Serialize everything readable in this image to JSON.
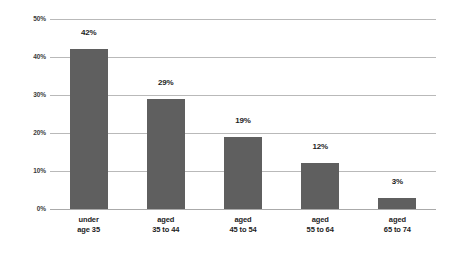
{
  "chart_data": {
    "type": "bar",
    "title": "",
    "subtitle": "",
    "xlabel": "",
    "ylabel": "",
    "ylim": [
      0,
      50
    ],
    "grid": true,
    "legend": "none",
    "orientation": "vertical",
    "categories": [
      "under\nage 35",
      "aged\n35 to 44",
      "aged\n45 to 54",
      "aged\n55 to 64",
      "aged\n65 to 74"
    ],
    "category_lines": [
      [
        "under",
        "age 35"
      ],
      [
        "aged",
        "35 to 44"
      ],
      [
        "aged",
        "45 to 54"
      ],
      [
        "aged",
        "55 to 64"
      ],
      [
        "aged",
        "65 to 74"
      ]
    ],
    "values": [
      42,
      29,
      19,
      12,
      3
    ],
    "value_labels": [
      "42%",
      "29%",
      "19%",
      "12%",
      "3%"
    ],
    "y_ticks": [
      0,
      10,
      20,
      30,
      40,
      50
    ],
    "y_tick_labels": [
      "0%",
      "10%",
      "20%",
      "30%",
      "40%",
      "50%"
    ],
    "colors": {
      "bar": "#5f5f5f",
      "gridline": "#b9b9b9",
      "baseline": "#aaaaaa",
      "value_label": "#1d1d1d",
      "tick_label": "#3b3b3b",
      "background": "#ffffff"
    }
  }
}
